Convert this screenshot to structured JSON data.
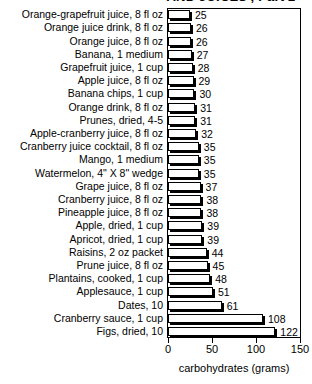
{
  "chart_data": {
    "type": "bar",
    "orientation": "horizontal",
    "title": "AND JUICES', Part 2",
    "xlabel": "carbohydrates (grams)",
    "ylabel": "",
    "xlim": [
      0,
      150
    ],
    "xticks": [
      0,
      50,
      100,
      150
    ],
    "grid": false,
    "legend": null,
    "categories": [
      "Orange-grapefruit juice, 8 fl oz",
      "Orange juice drink, 8 fl oz",
      "Orange juice, 8 fl oz",
      "Banana, 1 medium",
      "Grapefruit juice, 1 cup",
      "Apple juice, 8 fl oz",
      "Banana chips, 1 cup",
      "Orange drink, 8 fl oz",
      "Prunes, dried, 4-5",
      "Apple-cranberry juice, 8 fl oz",
      "Cranberry juice cocktail, 8 fl oz",
      "Mango, 1 medium",
      "Watermelon, 4\" X 8\" wedge",
      "Grape juice, 8 fl oz",
      "Cranberry juice, 8 fl oz",
      "Pineapple juice, 8 fl oz",
      "Apple, dried, 1 cup",
      "Apricot, dried, 1 cup",
      "Raisins, 2 oz packet",
      "Prune juice, 8 fl oz",
      "Plantains, cooked, 1 cup",
      "Applesauce, 1 cup",
      "Dates, 10",
      "Cranberry sauce, 1 cup",
      "Figs, dried, 10"
    ],
    "values": [
      25,
      26,
      26,
      27,
      28,
      29,
      30,
      31,
      31,
      32,
      35,
      35,
      35,
      37,
      38,
      38,
      39,
      39,
      44,
      45,
      48,
      51,
      61,
      108,
      122
    ]
  },
  "colors": {
    "background": "#ffffff",
    "ink": "#000000",
    "bar_fill": "#ffffff",
    "bar_outline": "#000000",
    "bar_shadow": "#000000"
  }
}
